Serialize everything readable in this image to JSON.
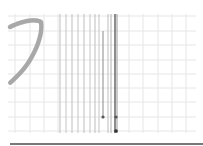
{
  "canvas": {
    "background": "#ffffff",
    "grid_color": "#e6e6e6",
    "grid_v": [
      15,
      30,
      44,
      58,
      129,
      143,
      158,
      172,
      186
    ],
    "grid_h": [
      16,
      31,
      45,
      60,
      74,
      88,
      102,
      117,
      131
    ],
    "grid_extent": {
      "x0": 8,
      "x1": 196,
      "y0": 14,
      "y1": 133
    }
  },
  "vertical_lines": [
    {
      "x": 60,
      "y0": 14,
      "y1": 133,
      "color": "#bdbdbd",
      "width": 1
    },
    {
      "x": 66,
      "y0": 14,
      "y1": 133,
      "color": "#c4c4c4",
      "width": 1
    },
    {
      "x": 72,
      "y0": 14,
      "y1": 133,
      "color": "#bdbdbd",
      "width": 1
    },
    {
      "x": 78,
      "y0": 14,
      "y1": 133,
      "color": "#c4c4c4",
      "width": 1
    },
    {
      "x": 84,
      "y0": 14,
      "y1": 133,
      "color": "#bdbdbd",
      "width": 1
    },
    {
      "x": 90,
      "y0": 14,
      "y1": 133,
      "color": "#c4c4c4",
      "width": 1
    },
    {
      "x": 95,
      "y0": 14,
      "y1": 133,
      "color": "#bdbdbd",
      "width": 1
    },
    {
      "x": 99,
      "y0": 14,
      "y1": 133,
      "color": "#c4c4c4",
      "width": 1
    },
    {
      "x": 103,
      "y0": 31,
      "y1": 117,
      "color": "#8a8a8a",
      "width": 1
    },
    {
      "x": 108,
      "y0": 14,
      "y1": 133,
      "color": "#bdbdbd",
      "width": 1
    },
    {
      "x": 111,
      "y0": 14,
      "y1": 133,
      "color": "#b0b0b0",
      "width": 1
    },
    {
      "x": 115,
      "y0": 14,
      "y1": 133,
      "color": "#707070",
      "width": 1.6
    },
    {
      "x": 117,
      "y0": 14,
      "y1": 133,
      "color": "#9a9a9a",
      "width": 1
    }
  ],
  "markers": [
    {
      "x": 103,
      "y": 117,
      "r": 1.6,
      "color": "#555555"
    },
    {
      "x": 116,
      "y": 117,
      "r": 1.6,
      "color": "#555555"
    },
    {
      "x": 116,
      "y": 131,
      "r": 1.8,
      "color": "#333333"
    }
  ],
  "stroke": {
    "path": "M 10 27 C 20 22, 34 18, 41 22 C 43 34, 36 52, 26 66 C 20 74, 14 79, 10 83",
    "color": "#a8a8a8",
    "width": 4.5
  },
  "baseline": {
    "x0": 10,
    "x1": 203,
    "y": 144,
    "color": "#4a4a4a",
    "width": 1.5
  }
}
